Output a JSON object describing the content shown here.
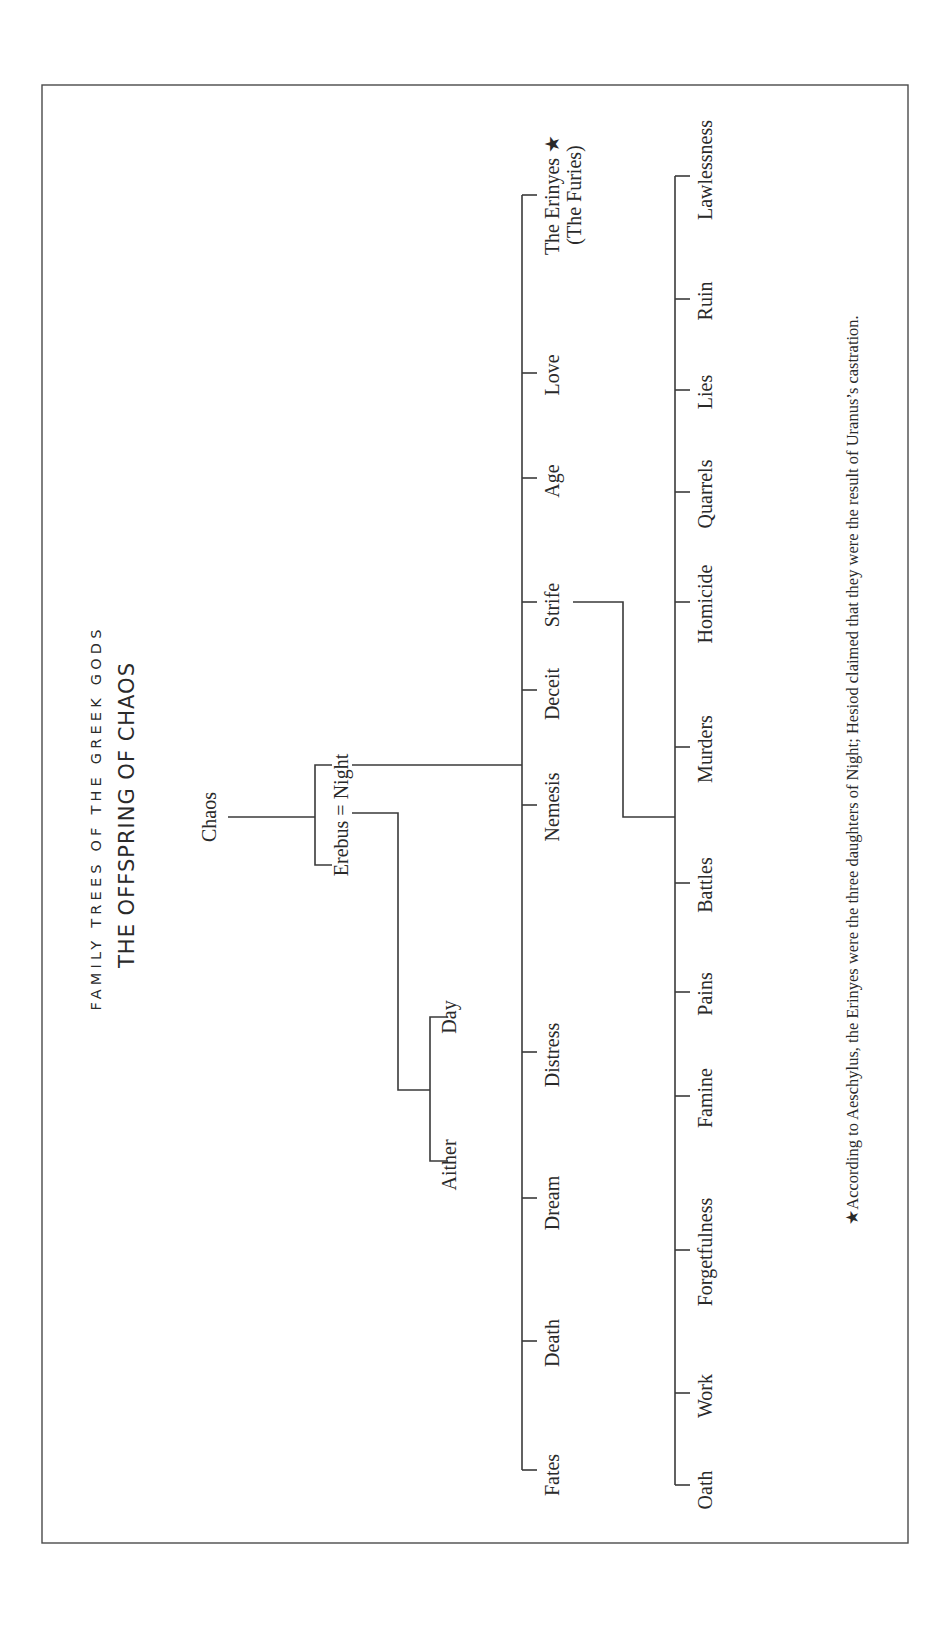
{
  "header": {
    "kicker": "FAMILY TREES OF THE GREEK GODS",
    "title": "THE OFFSPRING OF CHAOS"
  },
  "root": {
    "name": "Chaos",
    "children_couple": {
      "left": "Erebus",
      "joiner": "=",
      "right": "Night",
      "label": "Erebus = Night"
    }
  },
  "erebus_night_children": [
    "Aither",
    "Day"
  ],
  "night_children": [
    {
      "name": "Fates"
    },
    {
      "name": "Death"
    },
    {
      "name": "Dream"
    },
    {
      "name": "Distress"
    },
    {
      "name": "Nemesis"
    },
    {
      "name": "Deceit"
    },
    {
      "name": "Strife"
    },
    {
      "name": "Age"
    },
    {
      "name": "Love"
    },
    {
      "name": "The Erinyes ★",
      "subtitle": "(The Furies)"
    }
  ],
  "strife_children": [
    "Oath",
    "Work",
    "Forgetfulness",
    "Famine",
    "Pains",
    "Battles",
    "Murders",
    "Homicide",
    "Quarrels",
    "Lies",
    "Ruin",
    "Lawlessness"
  ],
  "footnote": "★According to Aeschylus, the Erinyes were the three daughters of Night; Hesiod claimed that they were the result of Uranus’s castration.",
  "colors": {
    "ink": "#2a2a2a",
    "lines": "#3a3a3a",
    "paper": "#ffffff"
  }
}
